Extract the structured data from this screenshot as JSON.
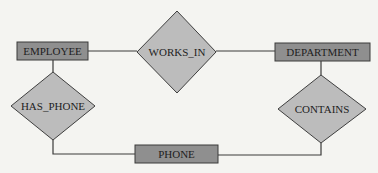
{
  "diagram": {
    "type": "er-diagram",
    "entities": [
      {
        "id": "employee",
        "label": "EMPLOYEE"
      },
      {
        "id": "department",
        "label": "DEPARTMENT"
      },
      {
        "id": "phone",
        "label": "PHONE"
      }
    ],
    "relationships": [
      {
        "id": "works_in",
        "label": "WORKS_IN",
        "connects": [
          "employee",
          "department"
        ]
      },
      {
        "id": "has_phone",
        "label": "HAS_PHONE",
        "connects": [
          "employee",
          "phone"
        ]
      },
      {
        "id": "contains",
        "label": "CONTAINS",
        "connects": [
          "department",
          "phone"
        ]
      }
    ],
    "colors": {
      "entity_fill": "#8f8f8f",
      "relationship_fill": "#bcbcbc",
      "line": "#3a3a3a",
      "background": "#f4f4f1"
    }
  }
}
